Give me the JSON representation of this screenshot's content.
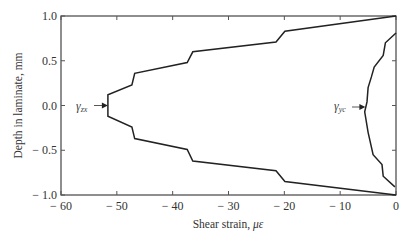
{
  "chart_data": {
    "type": "line",
    "title": "",
    "xlabel": "Shear strain, με",
    "ylabel": "Depth in laminate, mm",
    "xlim": [
      -60,
      0
    ],
    "ylim": [
      -1.0,
      1.0
    ],
    "x_ticks": [
      "− 60",
      "− 50",
      "− 40",
      "− 30",
      "− 20",
      "− 10",
      "0"
    ],
    "y_ticks": [
      "1.0",
      "0.5",
      "0.0",
      "− 0.5",
      "− 1.0"
    ],
    "grid": false,
    "legend": null,
    "series": [
      {
        "name": "γzx",
        "points": [
          [
            0.0,
            1.0
          ],
          [
            -19.9,
            0.83
          ],
          [
            -21.5,
            0.71
          ],
          [
            -36.4,
            0.6
          ],
          [
            -37.4,
            0.48
          ],
          [
            -46.8,
            0.36
          ],
          [
            -47.3,
            0.23
          ],
          [
            -51.6,
            0.12
          ],
          [
            -51.6,
            -0.12
          ],
          [
            -47.3,
            -0.24
          ],
          [
            -46.8,
            -0.37
          ],
          [
            -37.4,
            -0.49
          ],
          [
            -36.4,
            -0.62
          ],
          [
            -21.5,
            -0.73
          ],
          [
            -19.9,
            -0.85
          ],
          [
            0.0,
            -1.0
          ]
        ]
      },
      {
        "name": "γyc",
        "points": [
          [
            0.0,
            0.81
          ],
          [
            -1.9,
            0.7
          ],
          [
            -2.3,
            0.56
          ],
          [
            -3.9,
            0.43
          ],
          [
            -4.4,
            0.32
          ],
          [
            -5.0,
            0.2
          ],
          [
            -5.2,
            0.04
          ],
          [
            -5.6,
            -0.07
          ],
          [
            -5.0,
            -0.3
          ],
          [
            -4.1,
            -0.55
          ],
          [
            -2.5,
            -0.66
          ],
          [
            -2.3,
            -0.79
          ],
          [
            -0.2,
            -0.91
          ]
        ]
      }
    ],
    "annotations": [
      {
        "text": "γ",
        "sub": "zx",
        "arrow_to": [
          -51.6,
          0.0
        ]
      },
      {
        "text": "γ",
        "sub": "yc",
        "arrow_to": [
          -5.4,
          -0.02
        ]
      }
    ]
  },
  "labels": {
    "xlabel": "Shear strain, ",
    "xlabel_unit": "με",
    "ylabel": "Depth in laminate, mm",
    "gamma": "γ",
    "zx_sub": "zx",
    "yc_sub": "yc"
  }
}
